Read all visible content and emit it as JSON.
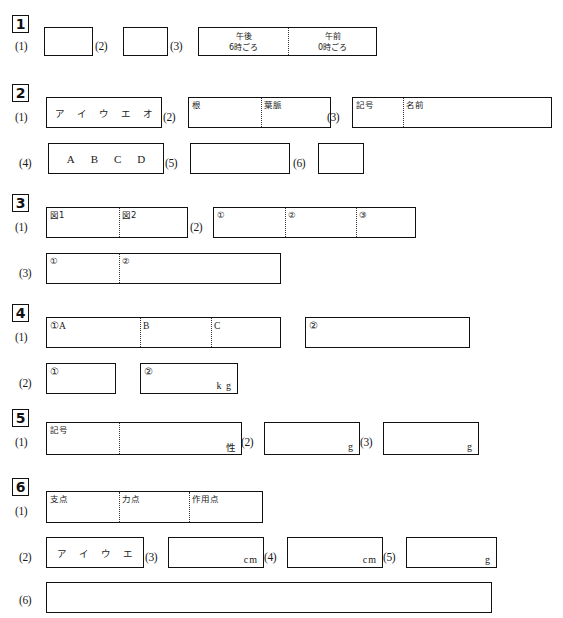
{
  "document": {
    "type": "answer-sheet",
    "language": "ja",
    "width": 563,
    "height": 618
  },
  "sections": [
    {
      "number": "1",
      "questions": [
        {
          "label": "(1)",
          "cells": []
        },
        {
          "label": "(2)",
          "cells": []
        },
        {
          "label": "(3)",
          "cells": [
            {
              "line1": "午後",
              "line2": "6時ごろ"
            },
            {
              "line1": "午前",
              "line2": "0時ごろ"
            }
          ]
        }
      ]
    },
    {
      "number": "2",
      "questions": [
        {
          "label": "(1)",
          "choices": [
            "ア",
            "イ",
            "ウ",
            "エ",
            "オ"
          ]
        },
        {
          "label": "(2)",
          "cells": [
            {
              "text": "根"
            },
            {
              "text": "葉脈"
            }
          ]
        },
        {
          "label": "(3)",
          "cells": [
            {
              "text": "記号"
            },
            {
              "text": "名前"
            }
          ]
        },
        {
          "label": "(4)",
          "choices": [
            "A",
            "B",
            "C",
            "D"
          ]
        },
        {
          "label": "(5)",
          "cells": []
        },
        {
          "label": "(6)",
          "cells": []
        }
      ]
    },
    {
      "number": "3",
      "questions": [
        {
          "label": "(1)",
          "cells": [
            {
              "text": "図1"
            },
            {
              "text": "図2"
            }
          ]
        },
        {
          "label": "(2)",
          "cells": [
            {
              "text": "①"
            },
            {
              "text": "②"
            },
            {
              "text": "③"
            }
          ]
        },
        {
          "label": "(3)",
          "cells": [
            {
              "text": "①"
            },
            {
              "text": "②"
            }
          ]
        }
      ]
    },
    {
      "number": "4",
      "questions": [
        {
          "label": "(1)",
          "cells": [
            {
              "text": "①A"
            },
            {
              "text": "B"
            },
            {
              "text": "C"
            }
          ],
          "extra": {
            "text": "②"
          }
        },
        {
          "label": "(2)",
          "cells": [
            {
              "text": "①"
            }
          ],
          "extra": {
            "text": "②",
            "unit": "k g"
          }
        }
      ]
    },
    {
      "number": "5",
      "questions": [
        {
          "label": "(1)",
          "cells": [
            {
              "text": "記号"
            },
            {
              "text": ""
            }
          ],
          "unit": "性"
        },
        {
          "label": "(2)",
          "cells": [],
          "unit": "g"
        },
        {
          "label": "(3)",
          "cells": [],
          "unit": "g"
        }
      ]
    },
    {
      "number": "6",
      "questions": [
        {
          "label": "(1)",
          "cells": [
            {
              "text": "支点"
            },
            {
              "text": "力点"
            },
            {
              "text": "作用点"
            }
          ]
        },
        {
          "label": "(2)",
          "choices": [
            "ア",
            "イ",
            "ウ",
            "エ"
          ]
        },
        {
          "label": "(3)",
          "cells": [],
          "unit": "cm"
        },
        {
          "label": "(4)",
          "cells": [],
          "unit": "cm"
        },
        {
          "label": "(5)",
          "cells": [],
          "unit": "g"
        },
        {
          "label": "(6)",
          "cells": []
        }
      ]
    }
  ]
}
